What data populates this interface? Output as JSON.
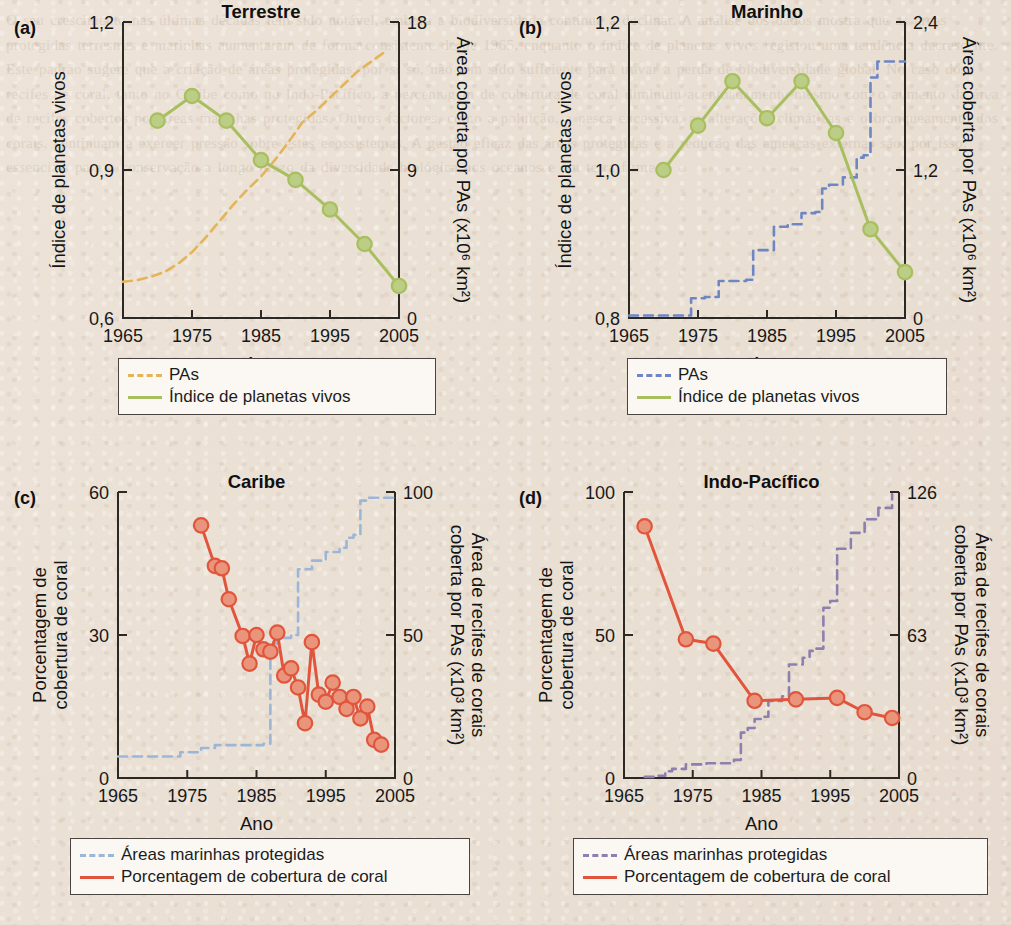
{
  "figure": {
    "background_color": "#e9dfd3",
    "axis_color": "#2c2824",
    "ghost_text": "O seu crescimento nas últimas décadas tem sido notável, embora a biodiversidade continue a declinar. A análise dos dados mostra que as áreas protegidas terrestres e marinhas aumentaram de forma consistente desde 1965, enquanto o índice de planetas vivos registou uma tendência decrescente. Este padrão sugere que a criação de áreas protegidas, por si só, não tem sido suficiente para travar a perda de biodiversidade global. No caso dos recifes de coral, tanto no Caribe como no Indo-Pacífico, a percentagem de cobertura de coral diminuiu acentuadamente mesmo com o aumento da área de recifes cobertos por áreas marinhas protegidas. Outros factores, como a poluição, a pesca excessiva, as alterações climáticas e o branqueamento dos corais, continuam a exercer pressão sobre estes ecossistemas. A gestão eficaz das áreas protegidas e a redução das ameaças externas são, por isso, essenciais para a conservação a longo prazo da diversidade biológica nos oceanos e em terra firme."
  },
  "chart_data": [
    {
      "panel_letter": "(a)",
      "type": "line",
      "title": "Terrestre",
      "xlabel": "Ano",
      "ylabel": "Índice de planetas vivos",
      "y2label": "Área coberta por PAs  (x10⁶ km²)",
      "xlim": [
        1965,
        2005
      ],
      "xticks": [
        1965,
        1975,
        1985,
        1995,
        2005
      ],
      "xticklabels": [
        "1965",
        "1975",
        "1985",
        "1995",
        "2005"
      ],
      "ylim": [
        0.6,
        1.2
      ],
      "yticks": [
        0.6,
        0.9,
        1.2
      ],
      "yticklabels": [
        "0,6",
        "0,9",
        "1,2"
      ],
      "y2lim": [
        0,
        18
      ],
      "y2ticks": [
        0,
        9,
        18
      ],
      "y2ticklabels": [
        "0",
        "9",
        "18"
      ],
      "series": [
        {
          "name": "PAs",
          "axis": "right",
          "style": "dashed",
          "color": "#e3b558",
          "x": [
            1965,
            1967,
            1969,
            1971,
            1973,
            1975,
            1977,
            1979,
            1981,
            1983,
            1985,
            1987,
            1989,
            1991,
            1993,
            1995,
            1997,
            1999,
            2001,
            2003
          ],
          "values": [
            2.2,
            2.3,
            2.5,
            2.8,
            3.3,
            4.0,
            4.9,
            5.9,
            6.9,
            7.8,
            8.6,
            9.6,
            10.7,
            11.9,
            12.6,
            13.4,
            14.2,
            15.0,
            15.6,
            16.2
          ]
        },
        {
          "name": "Índice de planetas vivos",
          "axis": "left",
          "style": "solid-markers",
          "color": "#a8bf5f",
          "marker_fill": "#bccd86",
          "x": [
            1970,
            1975,
            1980,
            1985,
            1990,
            1995,
            2000,
            2005
          ],
          "values": [
            1.0,
            1.05,
            1.0,
            0.92,
            0.88,
            0.82,
            0.75,
            0.665
          ]
        }
      ],
      "legend": {
        "position": "below",
        "entries": [
          {
            "label": "PAs",
            "color": "#e3b558",
            "style": "dashed"
          },
          {
            "label": "Índice de planetas vivos",
            "color": "#a8bf5f",
            "style": "solid"
          }
        ]
      }
    },
    {
      "panel_letter": "(b)",
      "type": "line",
      "title": "Marinho",
      "xlabel": "Ano",
      "ylabel": "Índice de planetas vivos",
      "y2label": "Área coberta por PAs  (x10⁶ km²)",
      "xlim": [
        1965,
        2005
      ],
      "xticks": [
        1965,
        1975,
        1985,
        1995,
        2005
      ],
      "xticklabels": [
        "1965",
        "1975",
        "1985",
        "1995",
        "2005"
      ],
      "ylim": [
        0.8,
        1.2
      ],
      "yticks": [
        0.8,
        1.0,
        1.2
      ],
      "yticklabels": [
        "0,8",
        "1,0",
        "1,2"
      ],
      "y2lim": [
        0,
        2.4
      ],
      "y2ticks": [
        0,
        1.2,
        2.4
      ],
      "y2ticklabels": [
        "0",
        "1,2",
        "2,4"
      ],
      "series": [
        {
          "name": "PAs",
          "axis": "right",
          "style": "step-dashed",
          "color": "#6f86c4",
          "x": [
            1965,
            1973,
            1974,
            1976,
            1978,
            1982,
            1983,
            1986,
            1988,
            1990,
            1992,
            1993,
            1994,
            1996,
            1998,
            1999,
            2000,
            2001,
            2005
          ],
          "values": [
            0.02,
            0.02,
            0.16,
            0.17,
            0.3,
            0.31,
            0.55,
            0.74,
            0.76,
            0.85,
            0.86,
            1.05,
            1.08,
            1.14,
            1.3,
            1.32,
            1.95,
            2.08,
            2.08
          ]
        },
        {
          "name": "Índice de planetas vivos",
          "axis": "left",
          "style": "solid-markers",
          "color": "#a8bf5f",
          "marker_fill": "#bccd86",
          "x": [
            1970,
            1975,
            1980,
            1985,
            1990,
            1995,
            2000,
            2005
          ],
          "values": [
            1.0,
            1.06,
            1.12,
            1.07,
            1.12,
            1.05,
            0.92,
            0.862
          ]
        }
      ],
      "legend": {
        "position": "below",
        "entries": [
          {
            "label": "PAs",
            "color": "#6f86c4",
            "style": "dashed"
          },
          {
            "label": "Índice de planetas vivos",
            "color": "#a8bf5f",
            "style": "solid"
          }
        ]
      }
    },
    {
      "panel_letter": "(c)",
      "type": "line",
      "title": "Caribe",
      "xlabel": "Ano",
      "ylabel": "Porcentagem de\ncobertura de coral",
      "y2label": "Área de recifes de corais\ncoberta por PAs (x10³ km²)",
      "xlim": [
        1965,
        2005
      ],
      "xticks": [
        1965,
        1975,
        1985,
        1995,
        2005
      ],
      "xticklabels": [
        "1965",
        "1975",
        "1985",
        "1995",
        "2005"
      ],
      "ylim": [
        0,
        60
      ],
      "yticks": [
        0,
        30,
        60
      ],
      "yticklabels": [
        "0",
        "30",
        "60"
      ],
      "y2lim": [
        0,
        100
      ],
      "y2ticks": [
        0,
        50,
        100
      ],
      "y2ticklabels": [
        "0",
        "50",
        "100"
      ],
      "series": [
        {
          "name": "Áreas marinhas protegidas",
          "axis": "right",
          "style": "step-dashed",
          "color": "#9cb6d8",
          "x": [
            1965,
            1972,
            1974,
            1977,
            1979,
            1982,
            1986,
            1987,
            1988,
            1989,
            1990,
            1991,
            1993,
            1995,
            1997,
            1998,
            1999,
            2000,
            2001,
            2005
          ],
          "values": [
            7.5,
            7.5,
            9.0,
            10.5,
            11.5,
            11.5,
            12.0,
            47.0,
            48.5,
            49.0,
            50.0,
            73.0,
            76.0,
            79.0,
            80.5,
            84.0,
            85.0,
            97.0,
            98.0,
            98.0
          ]
        },
        {
          "name": "Porcentagem de cobertura de coral",
          "axis": "left",
          "style": "solid-markers",
          "color": "#e2553c",
          "marker_fill": "#e8957c",
          "x": [
            1977,
            1979,
            1980,
            1981,
            1983,
            1984,
            1985,
            1986,
            1987,
            1988,
            1989,
            1990,
            1991,
            1992,
            1993,
            1994,
            1995,
            1996,
            1997,
            1998,
            1999,
            2000,
            2001,
            2002,
            2003
          ],
          "values": [
            53.0,
            44.5,
            44.0,
            37.5,
            29.8,
            24.0,
            30.0,
            27.0,
            26.5,
            30.5,
            21.5,
            23.0,
            19.0,
            11.5,
            28.5,
            17.5,
            16.0,
            20.0,
            17.0,
            14.5,
            17.0,
            12.5,
            15.0,
            8.0,
            7.0
          ]
        }
      ],
      "legend": {
        "position": "below",
        "entries": [
          {
            "label": "Áreas marinhas protegidas",
            "color": "#9cb6d8",
            "style": "dashed"
          },
          {
            "label": "Porcentagem de cobertura de coral",
            "color": "#e2553c",
            "style": "solid"
          }
        ]
      }
    },
    {
      "panel_letter": "(d)",
      "type": "line",
      "title": "Indo-Pacífico",
      "xlabel": "Ano",
      "ylabel": "Porcentagem de\ncobertura de coral",
      "y2label": "Área de recifes de corais\ncoberta por PAs (x10³ km²)",
      "xlim": [
        1965,
        2005
      ],
      "xticks": [
        1965,
        1975,
        1985,
        1995,
        2005
      ],
      "xticklabels": [
        "1965",
        "1975",
        "1985",
        "1995",
        "2005"
      ],
      "ylim": [
        0,
        100
      ],
      "yticks": [
        0,
        50,
        100
      ],
      "yticklabels": [
        "0",
        "50",
        "100"
      ],
      "y2lim": [
        0,
        126
      ],
      "y2ticks": [
        0,
        63,
        126
      ],
      "y2ticklabels": [
        "0",
        "63",
        "126"
      ],
      "series": [
        {
          "name": "Áreas marinhas protegidas",
          "axis": "right",
          "style": "step-dashed",
          "color": "#8d7fb0",
          "x": [
            1968,
            1970,
            1971,
            1972,
            1974,
            1977,
            1981,
            1982,
            1983,
            1984,
            1985,
            1986,
            1988,
            1989,
            1991,
            1992,
            1993,
            1994,
            1995,
            1996,
            1998,
            2000,
            2002,
            2004
          ],
          "values": [
            0.5,
            1.0,
            3.0,
            4.0,
            6.0,
            6.5,
            8.0,
            20.0,
            22.0,
            26.0,
            27.0,
            34.0,
            36.0,
            50.0,
            53.0,
            56.0,
            57.0,
            75.0,
            78.0,
            101.0,
            108.0,
            114.0,
            119.0,
            125.0
          ]
        },
        {
          "name": "Porcentagem de cobertura de coral",
          "axis": "left",
          "style": "solid-markers",
          "color": "#e2553c",
          "marker_fill": "#e8957c",
          "x": [
            1968,
            1974,
            1978,
            1984,
            1990,
            1996,
            2000,
            2004
          ],
          "values": [
            88.0,
            48.5,
            47.0,
            27.0,
            27.5,
            28.0,
            23.0,
            21.0
          ]
        }
      ],
      "legend": {
        "position": "below",
        "entries": [
          {
            "label": "Áreas marinhas protegidas",
            "color": "#8d7fb0",
            "style": "dashed"
          },
          {
            "label": "Porcentagem de cobertura de coral",
            "color": "#e2553c",
            "style": "solid"
          }
        ]
      }
    }
  ]
}
